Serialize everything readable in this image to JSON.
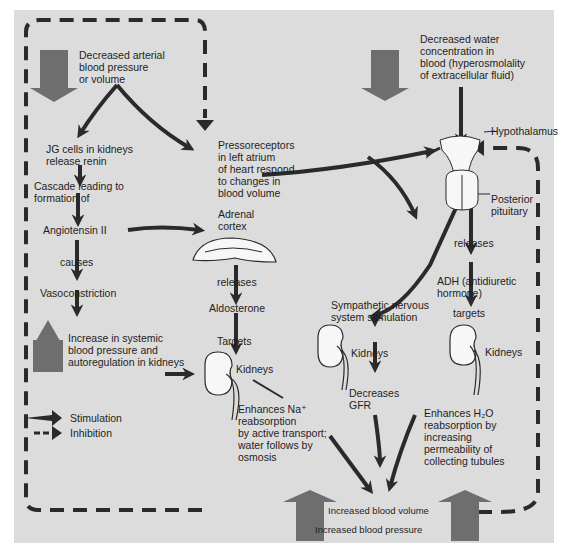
{
  "diagram": {
    "type": "flowchart",
    "topic": "Regulation of blood pressure and volume (renin-angiotensin-aldosterone and ADH pathways)",
    "colors": {
      "panel_background": "#dcdcdc",
      "page_background": "#ffffff",
      "big_arrow_fill": "#6e6e6e",
      "arrow_dark": "#2a2a2a",
      "organ_fill": "#f7f7f7",
      "text": "#1e1e1e"
    },
    "nodes": {
      "decreased_bp": "Decreased arterial\nblood pressure\nor volume",
      "jg_cells": "JG cells in kidneys\nrelease renin",
      "cascade": "Cascade leading to\nformation of",
      "angiotensin": "Angiotensin II",
      "causes": "causes",
      "vasoconstriction": "Vasoconstriction",
      "increase_systemic": "Increase in systemic\nblood pressure and\nautoregulation in kidneys",
      "pressoreceptors": "Pressoreceptors\nin left atrium\nof heart respond\nto changes in\nblood volume",
      "adrenal_cortex": "Adrenal\ncortex",
      "releases_left": "releases",
      "aldosterone": "Aldosterone",
      "targets_left": "Targets",
      "kidneys_left": "Kidneys",
      "enhances_na": "Enhances Na⁺\nreabsorption\nby active transport;\nwater follows by\nosmosis",
      "decreased_water": "Decreased water\nconcentration in\nblood (hyperosmolality\nof extracellular fluid)",
      "hypothalamus": "Hypothalamus",
      "posterior_pituitary": "Posterior\npituitary",
      "releases_right": "releases",
      "adh": "ADH (antidiuretic\nhormone)",
      "targets_right": "targets",
      "kidneys_right": "Kidneys",
      "sympathetic": "Sympathetic nervous\nsystem stimulation",
      "kidneys_mid": "Kidneys",
      "decreases_gfr": "Decreases\nGFR",
      "enhances_h2o": "Enhances H₂O\nreabsorption by\nincreasing\npermeability of\ncollecting tubules",
      "increased_volume": "Increased blood volume",
      "increased_pressure": "Increased blood pressure"
    },
    "legend": {
      "stimulation": "Stimulation",
      "inhibition": "Inhibition"
    },
    "edges": [
      {
        "from": "decreased_bp",
        "to": "jg_cells",
        "kind": "stimulation"
      },
      {
        "from": "decreased_bp",
        "to": "pressoreceptors",
        "kind": "stimulation"
      },
      {
        "from": "jg_cells",
        "to": "cascade",
        "kind": "stimulation"
      },
      {
        "from": "cascade",
        "to": "angiotensin",
        "kind": "stimulation"
      },
      {
        "from": "angiotensin",
        "to": "vasoconstriction",
        "kind": "stimulation",
        "label": "causes"
      },
      {
        "from": "angiotensin",
        "to": "adrenal_cortex",
        "kind": "stimulation"
      },
      {
        "from": "vasoconstriction",
        "to": "increase_systemic",
        "kind": "stimulation"
      },
      {
        "from": "increase_systemic",
        "to": "kidneys_left",
        "kind": "stimulation"
      },
      {
        "from": "adrenal_cortex",
        "to": "aldosterone",
        "kind": "stimulation",
        "label": "releases"
      },
      {
        "from": "aldosterone",
        "to": "kidneys_left",
        "kind": "stimulation",
        "label": "Targets"
      },
      {
        "from": "kidneys_left",
        "to": "enhances_na",
        "kind": "stimulation"
      },
      {
        "from": "pressoreceptors",
        "to": "hypothalamus",
        "kind": "stimulation"
      },
      {
        "from": "pressoreceptors",
        "to": "sympathetic",
        "kind": "stimulation"
      },
      {
        "from": "decreased_water",
        "to": "hypothalamus",
        "kind": "stimulation"
      },
      {
        "from": "hypothalamus",
        "to": "sympathetic",
        "kind": "stimulation"
      },
      {
        "from": "posterior_pituitary",
        "to": "adh",
        "kind": "stimulation",
        "label": "releases"
      },
      {
        "from": "adh",
        "to": "kidneys_right",
        "kind": "stimulation",
        "label": "targets"
      },
      {
        "from": "kidneys_right",
        "to": "enhances_h2o",
        "kind": "stimulation"
      },
      {
        "from": "sympathetic",
        "to": "kidneys_mid",
        "kind": "stimulation"
      },
      {
        "from": "kidneys_mid",
        "to": "decreases_gfr",
        "kind": "stimulation"
      },
      {
        "from": "enhances_na",
        "to": "increased_volume",
        "kind": "stimulation"
      },
      {
        "from": "decreases_gfr",
        "to": "increased_volume",
        "kind": "stimulation"
      },
      {
        "from": "enhances_h2o",
        "to": "increased_volume",
        "kind": "stimulation"
      },
      {
        "from": "increased_pressure",
        "to": "pressoreceptors",
        "kind": "inhibition"
      },
      {
        "from": "increased_pressure",
        "to": "hypothalamus",
        "kind": "inhibition"
      }
    ]
  }
}
